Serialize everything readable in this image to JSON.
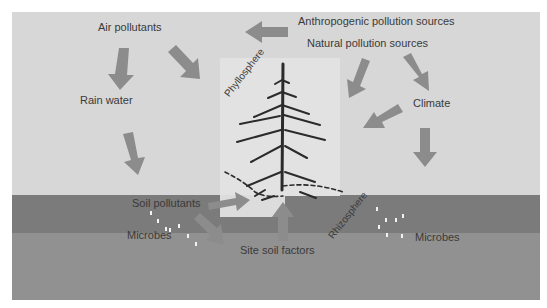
{
  "diagram": {
    "labels": {
      "air_pollutants": "Air pollutants",
      "anthropogenic": "Anthropogenic pollution sources",
      "natural": "Natural pollution sources",
      "rain_water": "Rain water",
      "climate": "Climate",
      "phyllosphere": "Phyllosphere",
      "rhizosphere": "Rhizosphere",
      "soil_pollutants": "Soil pollutants",
      "microbes_left": "Microbes",
      "microbes_right": "Microbes",
      "site_soil_factors": "Site soil factors"
    },
    "colors": {
      "background": "#ffffff",
      "sky": "#d7d7d7",
      "topsoil": "#7b7b7b",
      "subsoil": "#919191",
      "tree_panel": "#e2e2e2",
      "arrow": "#8c8c8c",
      "text": "#3a3a3a"
    }
  }
}
